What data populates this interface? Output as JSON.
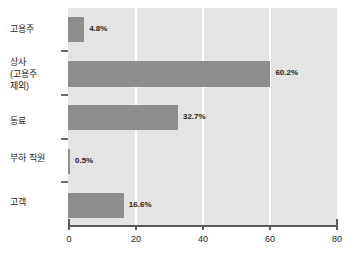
{
  "chart_data": {
    "type": "bar",
    "orientation": "horizontal",
    "title": "",
    "subtitle": "",
    "xlabel": "",
    "ylabel": "",
    "xlim": [
      0,
      80
    ],
    "xticks": [
      0,
      20,
      40,
      60,
      80
    ],
    "xtick_labels": [
      "0",
      "20",
      "40",
      "60",
      "80"
    ],
    "grid": true,
    "grid_axis": "x",
    "legend": false,
    "legend_position": "none",
    "value_suffix": "%",
    "categories": [
      "고용주",
      "상사\n(고용주\n제외)",
      "동료",
      "부하 직원",
      "고객"
    ],
    "values": [
      4.8,
      60.2,
      32.7,
      0.5,
      16.6
    ],
    "data_labels": [
      "4.8%",
      "60.2%",
      "32.7%",
      "0.5%",
      "16.6%"
    ],
    "colors": {
      "bar": "#8e8e8e",
      "plot_background": "#e4e4e4",
      "gridline": "#ffffff",
      "axis": "#5a5a5a",
      "text": "#1c1c1c",
      "page_background": "#ffffff"
    }
  }
}
